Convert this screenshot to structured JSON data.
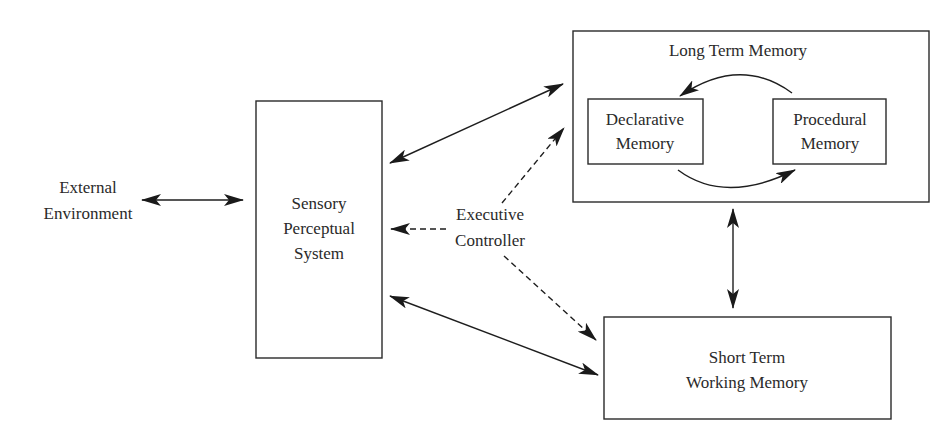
{
  "diagram": {
    "nodes": {
      "external_environment": {
        "line1": "External",
        "line2": "Environment"
      },
      "sensory_perceptual_system": {
        "line1": "Sensory",
        "line2": "Perceptual",
        "line3": "System"
      },
      "executive_controller": {
        "line1": "Executive",
        "line2": "Controller"
      },
      "long_term_memory": {
        "title": "Long Term Memory"
      },
      "declarative_memory": {
        "line1": "Declarative",
        "line2": "Memory"
      },
      "procedural_memory": {
        "line1": "Procedural",
        "line2": "Memory"
      },
      "short_term_working_memory": {
        "line1": "Short Term",
        "line2": "Working Memory"
      }
    },
    "edges": [
      {
        "from": "External Environment",
        "to": "Sensory Perceptual System",
        "style": "solid",
        "direction": "bidirectional"
      },
      {
        "from": "Sensory Perceptual System",
        "to": "Long Term Memory",
        "style": "solid",
        "direction": "bidirectional"
      },
      {
        "from": "Sensory Perceptual System",
        "to": "Short Term Working Memory",
        "style": "solid",
        "direction": "bidirectional"
      },
      {
        "from": "Long Term Memory",
        "to": "Short Term Working Memory",
        "style": "solid",
        "direction": "bidirectional"
      },
      {
        "from": "Executive Controller",
        "to": "Sensory Perceptual System",
        "style": "dashed",
        "direction": "forward"
      },
      {
        "from": "Executive Controller",
        "to": "Long Term Memory",
        "style": "dashed",
        "direction": "forward"
      },
      {
        "from": "Executive Controller",
        "to": "Short Term Working Memory",
        "style": "dashed",
        "direction": "forward"
      },
      {
        "from": "Procedural Memory",
        "to": "Declarative Memory",
        "style": "solid-curved",
        "direction": "forward"
      },
      {
        "from": "Declarative Memory",
        "to": "Procedural Memory",
        "style": "solid-curved",
        "direction": "forward"
      }
    ]
  }
}
